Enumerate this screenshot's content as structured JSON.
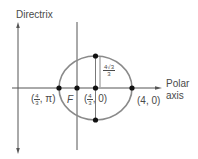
{
  "labels": {
    "directrix": "Directrix",
    "polar_axis_line1": "Polar",
    "polar_axis_line2": "axis",
    "focus": "F",
    "left_vertex": {
      "open": "(",
      "num": "4",
      "den": "3",
      "rest": ", π)"
    },
    "center": {
      "open": "(",
      "num": "4",
      "den": "3",
      "rest": ", 0)"
    },
    "right_vertex": "(4, 0)",
    "minor_half": {
      "num": "4√3",
      "den": "3"
    }
  },
  "colors": {
    "axis": "#555555",
    "ellipse": "#8a8a8a",
    "point": "#111111",
    "text": "#4a4a4a"
  }
}
